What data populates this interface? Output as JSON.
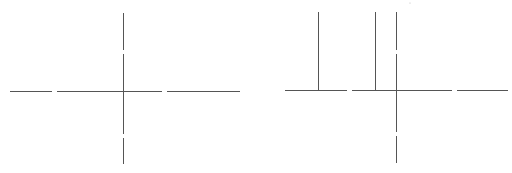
{
  "diagram": {
    "panels": [
      {
        "name": "left-axes",
        "description": "Cartesian axes crossing at origin",
        "line_color": "#555555",
        "vertical_markers": []
      },
      {
        "name": "right-axes",
        "description": "Cartesian axes with two vertical marker lines to the left of the y-axis",
        "line_color": "#555555",
        "vertical_markers_count": 2
      }
    ]
  }
}
